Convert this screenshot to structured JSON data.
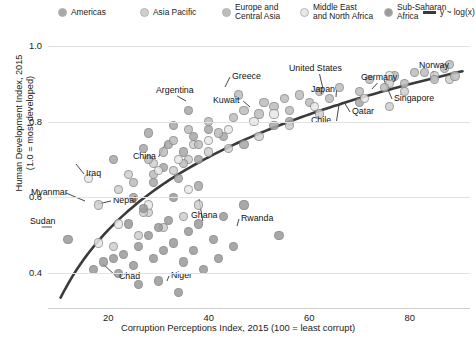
{
  "legend": {
    "items": [
      {
        "label": "Americas",
        "color": "#a8a8a8",
        "marker": "circle"
      },
      {
        "label": "Asia Pacific",
        "color": "#cfcfcf",
        "marker": "circle"
      },
      {
        "label": "Europe and\nCentral Asia",
        "color": "#bdbdbd",
        "marker": "circle"
      },
      {
        "label": "Middle East\nand North Africa",
        "color": "#e8e8e8",
        "marker": "circle"
      },
      {
        "label": "Sub-Saharan\nAfrica",
        "color": "#9a9a9a",
        "marker": "circle"
      },
      {
        "label": "y ~ log(x)",
        "color": "#3a3a3a",
        "marker": "line"
      }
    ]
  },
  "chart_data": {
    "type": "scatter",
    "title": "",
    "xlabel": "Corruption Perceptions Index, 2015 (100 = least corrupt)",
    "ylabel": "Human Development Index, 2015 (1.0 = most developed)",
    "xlim": [
      8,
      92
    ],
    "ylim": [
      0.33,
      1.02
    ],
    "xticks": [
      20,
      40,
      60,
      80
    ],
    "yticks": [
      1.0,
      0.8,
      0.6,
      0.4
    ],
    "grid": true,
    "legend_position": "top",
    "trendline": {
      "label": "y ~ log(x)",
      "color": "#3a3a3a",
      "width": 2.6
    },
    "series": [
      {
        "name": "Americas",
        "color": "#a8a8a8",
        "points": [
          {
            "x": 36,
            "y": 0.83,
            "label": "Argentina"
          },
          {
            "x": 70,
            "y": 0.85,
            "label": "Chile"
          },
          {
            "x": 21,
            "y": 0.7
          },
          {
            "x": 27,
            "y": 0.73
          },
          {
            "x": 28,
            "y": 0.77
          },
          {
            "x": 32,
            "y": 0.74
          },
          {
            "x": 33,
            "y": 0.79
          },
          {
            "x": 35,
            "y": 0.72
          },
          {
            "x": 37,
            "y": 0.76
          },
          {
            "x": 38,
            "y": 0.7
          },
          {
            "x": 40,
            "y": 0.78
          },
          {
            "x": 43,
            "y": 0.76
          },
          {
            "x": 47,
            "y": 0.74
          },
          {
            "x": 53,
            "y": 0.79
          },
          {
            "x": 56,
            "y": 0.8
          },
          {
            "x": 29,
            "y": 0.64
          },
          {
            "x": 31,
            "y": 0.68
          },
          {
            "x": 34,
            "y": 0.65
          },
          {
            "x": 25,
            "y": 0.6
          },
          {
            "x": 38,
            "y": 0.63
          }
        ]
      },
      {
        "name": "Asia Pacific",
        "color": "#cfcfcf",
        "points": [
          {
            "x": 37,
            "y": 0.74,
            "label": "China"
          },
          {
            "x": 28,
            "y": 0.56,
            "label": "Myanmar"
          },
          {
            "x": 27,
            "y": 0.56,
            "label": "Nepal"
          },
          {
            "x": 35,
            "y": 0.55,
            "label": "Nepal2"
          },
          {
            "x": 76,
            "y": 0.9,
            "label": "Japan"
          },
          {
            "x": 85,
            "y": 0.92,
            "label": "Singapore"
          },
          {
            "x": 18,
            "y": 0.58
          },
          {
            "x": 22,
            "y": 0.62
          },
          {
            "x": 24,
            "y": 0.66
          },
          {
            "x": 29,
            "y": 0.69
          },
          {
            "x": 33,
            "y": 0.67
          },
          {
            "x": 36,
            "y": 0.7
          },
          {
            "x": 40,
            "y": 0.72
          },
          {
            "x": 44,
            "y": 0.73
          },
          {
            "x": 50,
            "y": 0.76
          },
          {
            "x": 56,
            "y": 0.79
          },
          {
            "x": 62,
            "y": 0.82
          },
          {
            "x": 76,
            "y": 0.84
          },
          {
            "x": 79,
            "y": 0.88
          },
          {
            "x": 88,
            "y": 0.91
          },
          {
            "x": 26,
            "y": 0.5
          },
          {
            "x": 31,
            "y": 0.52
          },
          {
            "x": 38,
            "y": 0.58
          },
          {
            "x": 21,
            "y": 0.47
          }
        ]
      },
      {
        "name": "Europe and Central Asia",
        "color": "#bdbdbd",
        "points": [
          {
            "x": 46,
            "y": 0.87,
            "label": "Greece"
          },
          {
            "x": 81,
            "y": 0.93,
            "label": "Germany"
          },
          {
            "x": 88,
            "y": 0.95,
            "label": "Norway"
          },
          {
            "x": 28,
            "y": 0.7
          },
          {
            "x": 31,
            "y": 0.72
          },
          {
            "x": 33,
            "y": 0.75
          },
          {
            "x": 36,
            "y": 0.78
          },
          {
            "x": 38,
            "y": 0.74
          },
          {
            "x": 40,
            "y": 0.8
          },
          {
            "x": 42,
            "y": 0.77
          },
          {
            "x": 45,
            "y": 0.81
          },
          {
            "x": 47,
            "y": 0.83
          },
          {
            "x": 50,
            "y": 0.82
          },
          {
            "x": 51,
            "y": 0.85
          },
          {
            "x": 53,
            "y": 0.84
          },
          {
            "x": 55,
            "y": 0.86
          },
          {
            "x": 56,
            "y": 0.83
          },
          {
            "x": 58,
            "y": 0.87
          },
          {
            "x": 60,
            "y": 0.85
          },
          {
            "x": 62,
            "y": 0.88
          },
          {
            "x": 64,
            "y": 0.86
          },
          {
            "x": 66,
            "y": 0.89
          },
          {
            "x": 70,
            "y": 0.88
          },
          {
            "x": 72,
            "y": 0.91
          },
          {
            "x": 75,
            "y": 0.89
          },
          {
            "x": 77,
            "y": 0.92
          },
          {
            "x": 79,
            "y": 0.9
          },
          {
            "x": 83,
            "y": 0.93
          },
          {
            "x": 85,
            "y": 0.91
          },
          {
            "x": 87,
            "y": 0.94
          },
          {
            "x": 89,
            "y": 0.92
          },
          {
            "x": 29,
            "y": 0.66
          },
          {
            "x": 35,
            "y": 0.69
          },
          {
            "x": 25,
            "y": 0.64
          }
        ]
      },
      {
        "name": "Middle East and North Africa",
        "color": "#e8e8e8",
        "points": [
          {
            "x": 49,
            "y": 0.8,
            "label": "Kuwait"
          },
          {
            "x": 71,
            "y": 0.86,
            "label": "Qatar"
          },
          {
            "x": 16,
            "y": 0.65,
            "label": "Iraq"
          },
          {
            "x": 76,
            "y": 0.92,
            "label": "United States"
          },
          {
            "x": 30,
            "y": 0.67
          },
          {
            "x": 34,
            "y": 0.7
          },
          {
            "x": 40,
            "y": 0.75
          },
          {
            "x": 44,
            "y": 0.78
          },
          {
            "x": 53,
            "y": 0.82
          },
          {
            "x": 61,
            "y": 0.84
          },
          {
            "x": 36,
            "y": 0.62
          },
          {
            "x": 28,
            "y": 0.58
          },
          {
            "x": 22,
            "y": 0.53
          },
          {
            "x": 18,
            "y": 0.48
          }
        ]
      },
      {
        "name": "Sub-Saharan Africa",
        "color": "#9a9a9a",
        "points": [
          {
            "x": 12,
            "y": 0.49,
            "label": "Sudan"
          },
          {
            "x": 22,
            "y": 0.4,
            "label": "Chad"
          },
          {
            "x": 34,
            "y": 0.35,
            "label": "Niger"
          },
          {
            "x": 47,
            "y": 0.58,
            "label": "Ghana"
          },
          {
            "x": 54,
            "y": 0.5,
            "label": "Rwanda"
          },
          {
            "x": 17,
            "y": 0.41
          },
          {
            "x": 19,
            "y": 0.43
          },
          {
            "x": 23,
            "y": 0.45
          },
          {
            "x": 25,
            "y": 0.42
          },
          {
            "x": 26,
            "y": 0.47
          },
          {
            "x": 28,
            "y": 0.5
          },
          {
            "x": 29,
            "y": 0.44
          },
          {
            "x": 30,
            "y": 0.52
          },
          {
            "x": 31,
            "y": 0.46
          },
          {
            "x": 32,
            "y": 0.54
          },
          {
            "x": 33,
            "y": 0.48
          },
          {
            "x": 35,
            "y": 0.43
          },
          {
            "x": 36,
            "y": 0.51
          },
          {
            "x": 37,
            "y": 0.46
          },
          {
            "x": 38,
            "y": 0.53
          },
          {
            "x": 39,
            "y": 0.41
          },
          {
            "x": 41,
            "y": 0.49
          },
          {
            "x": 42,
            "y": 0.44
          },
          {
            "x": 43,
            "y": 0.55
          },
          {
            "x": 45,
            "y": 0.47
          },
          {
            "x": 30,
            "y": 0.38
          },
          {
            "x": 26,
            "y": 0.37
          },
          {
            "x": 21,
            "y": 0.44
          },
          {
            "x": 24,
            "y": 0.53
          },
          {
            "x": 27,
            "y": 0.57
          },
          {
            "x": 33,
            "y": 0.6
          }
        ]
      }
    ],
    "annotations": [
      {
        "label": "Argentina",
        "tx": 156,
        "ty": 86,
        "px": 186,
        "py": 101
      },
      {
        "label": "Greece",
        "tx": 232,
        "ty": 72,
        "px": 225,
        "py": 87
      },
      {
        "label": "Kuwait",
        "tx": 213,
        "ty": 96,
        "px": 250,
        "py": 107
      },
      {
        "label": "United States",
        "tx": 289,
        "ty": 64,
        "px": 323,
        "py": 89
      },
      {
        "label": "Japan",
        "tx": 311,
        "ty": 85,
        "px": 336,
        "py": 97
      },
      {
        "label": "Germany",
        "tx": 361,
        "ty": 73,
        "px": 372,
        "py": 89
      },
      {
        "label": "Norway",
        "tx": 419,
        "ty": 61,
        "px": 434,
        "py": 82
      },
      {
        "label": "Singapore",
        "tx": 394,
        "ty": 94,
        "px": 384,
        "py": 80
      },
      {
        "label": "Chile",
        "tx": 311,
        "ty": 116,
        "px": 339,
        "py": 105
      },
      {
        "label": "Qatar",
        "tx": 352,
        "ty": 107,
        "px": 344,
        "py": 102
      },
      {
        "label": "China",
        "tx": 133,
        "ty": 152,
        "px": 166,
        "py": 143
      },
      {
        "label": "Iraq",
        "tx": 86,
        "ty": 169,
        "px": 76,
        "py": 164
      },
      {
        "label": "Myanmar",
        "tx": 31,
        "ty": 188,
        "px": 85,
        "py": 201
      },
      {
        "label": "Nepal",
        "tx": 113,
        "ty": 196,
        "px": 98,
        "py": 204
      },
      {
        "label": "Sudan",
        "tx": 30,
        "ty": 217,
        "px": 52,
        "py": 227
      },
      {
        "label": "Ghana",
        "tx": 191,
        "ty": 211,
        "px": 199,
        "py": 199
      },
      {
        "label": "Rwanda",
        "tx": 241,
        "ty": 214,
        "px": 237,
        "py": 226
      },
      {
        "label": "Chad",
        "tx": 119,
        "ty": 272,
        "px": 103,
        "py": 264
      },
      {
        "label": "Niger",
        "tx": 171,
        "ty": 271,
        "px": 167,
        "py": 281
      }
    ]
  }
}
